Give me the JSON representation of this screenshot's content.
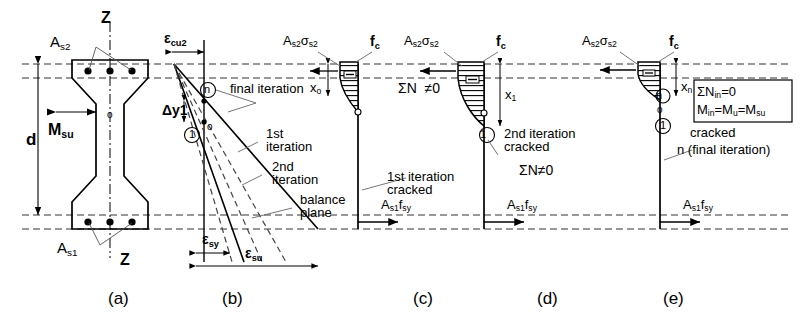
{
  "figure": {
    "type": "engineering-diagram",
    "panels": [
      {
        "id": "a",
        "label": "(a)",
        "caption": "cross-section"
      },
      {
        "id": "b",
        "label": "(b)",
        "caption": "strain distributions"
      },
      {
        "id": "c",
        "label": "(c)",
        "caption": "1st iteration cracked"
      },
      {
        "id": "d",
        "label": "(d)",
        "caption": "2nd iteration cracked"
      },
      {
        "id": "e",
        "label": "(e)",
        "caption": "n final iteration"
      }
    ]
  },
  "panel_a": {
    "top_steel": "A",
    "top_steel_sub": "s2",
    "bottom_steel": "A",
    "bottom_steel_sub": "s1",
    "axis_top": "Z",
    "axis_bottom": "Z",
    "centroid_mark": "o",
    "depth_label": "d",
    "moment_label": "M",
    "moment_sub": "su",
    "panel_label": "(a)"
  },
  "panel_b": {
    "strain_top": "ε",
    "strain_top_sub": "cu2",
    "delta_label": "Δ",
    "delta_sub": "y1",
    "marker_n": "n",
    "marker_1": "1",
    "marker_o": "o",
    "final_iteration": "final iteration",
    "first_iteration_l1": "1st",
    "first_iteration_l2": "iteration",
    "second_iteration_l1": "2nd",
    "second_iteration_l2": "iteration",
    "balance_l1": "balance",
    "balance_l2": "plane",
    "strain_sy": "ε",
    "strain_sy_sub": "sy",
    "strain_su": "ε",
    "strain_su_sub": "su",
    "panel_label": "(b)"
  },
  "panel_c": {
    "steel_force": "A",
    "steel_force_sub1": "s2",
    "steel_force_sigma": "σ",
    "steel_force_sub2": "s2",
    "concrete_stress": "f",
    "concrete_stress_sub": "c",
    "depth_x": "x",
    "depth_x_sub": "o",
    "sum_n": "ΣN",
    "sum_n_val": "≠0",
    "note_l1": "1st iteration",
    "note_l2": "cracked",
    "tension_force": "A",
    "tension_force_sub1": "s1",
    "tension_force_f": "f",
    "tension_force_sub2": "sy",
    "sign": "−",
    "marker_o": "o",
    "panel_label": "(c)"
  },
  "panel_d": {
    "steel_force": "A",
    "steel_force_sub1": "s2",
    "steel_force_sigma": "σ",
    "steel_force_sub2": "s2",
    "concrete_stress": "f",
    "concrete_stress_sub": "c",
    "depth_x": "x",
    "depth_x_sub": "1",
    "sum_n": "ΣN≠0",
    "note_l1": "2nd iteration",
    "note_l2": "cracked",
    "tension_force": "A",
    "tension_force_sub1": "s1",
    "tension_force_f": "f",
    "tension_force_sub2": "sy",
    "sign": "−",
    "marker_o": "o",
    "marker_1": "1",
    "panel_label": "(d)"
  },
  "panel_e": {
    "steel_force": "A",
    "steel_force_sub1": "s2",
    "steel_force_sigma": "σ",
    "steel_force_sub2": "s2",
    "concrete_stress": "f",
    "concrete_stress_sub": "c",
    "depth_x": "x",
    "depth_x_sub": "n",
    "note_l1": "cracked",
    "note_l2": "n (final iteration)",
    "tension_force": "A",
    "tension_force_sub1": "s1",
    "tension_force_f": "f",
    "tension_force_sub2": "sy",
    "sign": "−",
    "marker_n": "n",
    "marker_o": "o",
    "marker_1": "1",
    "equation_box": {
      "line1_a": "ΣN",
      "line1_sub": "in",
      "line1_b": "=0",
      "line2_a": "M",
      "line2_sub1": "in",
      "line2_b": "=M",
      "line2_sub2": "u",
      "line2_c": "=M",
      "line2_sub3": "su"
    },
    "panel_label": "(e)"
  },
  "colors": {
    "ink": "#000000",
    "dashed": "#333333",
    "leader": "#555555"
  }
}
